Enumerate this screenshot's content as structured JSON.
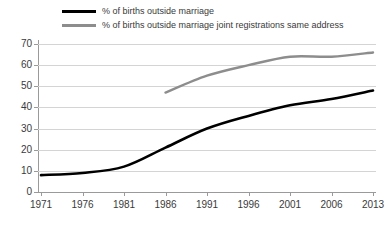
{
  "chart_data": {
    "type": "line",
    "title": "",
    "xlabel": "",
    "ylabel": "",
    "categories": [
      "1971",
      "1976",
      "1981",
      "1986",
      "1991",
      "1996",
      "2001",
      "2006",
      "2013"
    ],
    "x": [
      1971,
      1976,
      1981,
      1986,
      1991,
      1996,
      2001,
      2006,
      2013
    ],
    "ylim": [
      0,
      70
    ],
    "yticks": [
      0,
      10,
      20,
      30,
      40,
      50,
      60,
      70
    ],
    "ytick_labels": [
      "0",
      "10",
      "20",
      "30",
      "40",
      "50",
      "60",
      "70"
    ],
    "grid": true,
    "legend_position": "top",
    "series": [
      {
        "name": "% of births outside marriage",
        "color": "#000000",
        "values": [
          8,
          9,
          12,
          21,
          30,
          36,
          41,
          44,
          48
        ]
      },
      {
        "name": "% of births outside marriage joint registrations same address",
        "color": "#8d8d8d",
        "values": [
          null,
          null,
          null,
          47,
          55,
          60,
          64,
          64,
          66
        ]
      }
    ]
  },
  "legend": {
    "items": [
      {
        "label": "% of births outside marriage",
        "color": "#000000"
      },
      {
        "label": "% of births outside marriage joint registrations same address",
        "color": "#8d8d8d"
      }
    ]
  }
}
